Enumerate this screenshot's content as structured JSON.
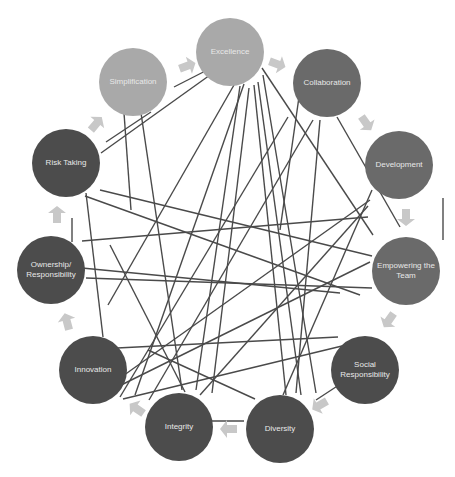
{
  "diagram": {
    "title": "",
    "colors": {
      "light": "#a9a9a9",
      "medium": "#6a6a6a",
      "dark": "#4c4c4c",
      "line": "#4a4a4a",
      "arrow": "#c8c8c8"
    },
    "nodes": [
      {
        "id": "excellence",
        "label": "Excellence",
        "cx": 230,
        "cy": 52,
        "tone": "light"
      },
      {
        "id": "collaboration",
        "label": "Collaboration",
        "cx": 327,
        "cy": 83,
        "tone": "medium"
      },
      {
        "id": "development",
        "label": "Development",
        "cx": 399,
        "cy": 165,
        "tone": "medium"
      },
      {
        "id": "empowering",
        "label": "Empowering the Team",
        "cx": 406,
        "cy": 271,
        "tone": "medium"
      },
      {
        "id": "social",
        "label": "Social Responsibility",
        "cx": 365,
        "cy": 370,
        "tone": "dark"
      },
      {
        "id": "diversity",
        "label": "Diversity",
        "cx": 280,
        "cy": 429,
        "tone": "dark"
      },
      {
        "id": "integrity",
        "label": "Integrity",
        "cx": 179,
        "cy": 427,
        "tone": "dark"
      },
      {
        "id": "innovation",
        "label": "Innovation",
        "cx": 93,
        "cy": 370,
        "tone": "dark"
      },
      {
        "id": "ownership",
        "label": "Ownership/ Responsibility",
        "cx": 51,
        "cy": 270,
        "tone": "dark"
      },
      {
        "id": "risk",
        "label": "Risk Taking",
        "cx": 66,
        "cy": 163,
        "tone": "dark"
      },
      {
        "id": "simplification",
        "label": "Simplification",
        "cx": 133,
        "cy": 82,
        "tone": "light"
      }
    ],
    "cycle_order": [
      "excellence",
      "collaboration",
      "development",
      "empowering",
      "social",
      "diversity",
      "integrity",
      "innovation",
      "ownership",
      "risk",
      "simplification"
    ],
    "lines": [
      [
        174,
        87,
        219,
        64
      ],
      [
        101,
        153,
        224,
        65
      ],
      [
        106,
        142,
        151,
        112
      ],
      [
        124,
        113,
        131,
        210
      ],
      [
        141,
        113,
        182,
        390
      ],
      [
        244,
        84,
        135,
        395
      ],
      [
        234,
        85,
        108,
        305
      ],
      [
        240,
        86,
        196,
        390
      ],
      [
        249,
        88,
        212,
        393
      ],
      [
        254,
        85,
        286,
        395
      ],
      [
        258,
        82,
        301,
        395
      ],
      [
        263,
        75,
        316,
        393
      ],
      [
        262,
        68,
        373,
        235
      ],
      [
        280,
        230,
        300,
        90
      ],
      [
        320,
        120,
        296,
        393
      ],
      [
        313,
        120,
        149,
        400
      ],
      [
        288,
        117,
        120,
        397
      ],
      [
        337,
        117,
        400,
        227
      ],
      [
        368,
        206,
        200,
        395
      ],
      [
        370,
        200,
        113,
        383
      ],
      [
        372,
        190,
        283,
        395
      ],
      [
        368,
        217,
        82,
        241
      ],
      [
        100,
        190,
        372,
        256
      ],
      [
        86,
        278,
        372,
        288
      ],
      [
        82,
        268,
        340,
        293
      ],
      [
        370,
        262,
        105,
        393
      ],
      [
        123,
        399,
        342,
        346
      ],
      [
        148,
        350,
        255,
        399
      ],
      [
        117,
        348,
        338,
        337
      ],
      [
        316,
        400,
        345,
        381
      ],
      [
        110,
        245,
        185,
        392
      ],
      [
        86,
        193,
        103,
        337
      ],
      [
        85,
        196,
        360,
        295
      ],
      [
        187,
        421,
        244,
        421
      ],
      [
        72,
        218,
        72,
        242
      ],
      [
        443,
        198,
        443,
        240
      ]
    ],
    "arrows": [
      {
        "x": 187,
        "y": 66,
        "rot": -20
      },
      {
        "x": 277,
        "y": 64,
        "rot": 20
      },
      {
        "x": 366,
        "y": 123,
        "rot": 55
      },
      {
        "x": 406,
        "y": 217,
        "rot": 90
      },
      {
        "x": 389,
        "y": 320,
        "rot": 125
      },
      {
        "x": 320,
        "y": 405,
        "rot": 150
      },
      {
        "x": 229,
        "y": 429,
        "rot": 180
      },
      {
        "x": 137,
        "y": 409,
        "rot": 215
      },
      {
        "x": 67,
        "y": 322,
        "rot": 255
      },
      {
        "x": 57,
        "y": 215,
        "rot": 270
      },
      {
        "x": 96,
        "y": 124,
        "rot": 310
      }
    ]
  }
}
